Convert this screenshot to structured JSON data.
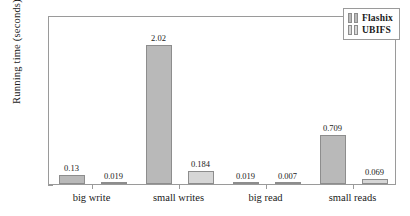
{
  "chart_data": {
    "type": "bar",
    "title": "",
    "subtitle": "",
    "xlabel": "",
    "ylabel": "Running time (seconds)",
    "categories": [
      "big write",
      "small writes",
      "big read",
      "small reads"
    ],
    "series": [
      {
        "name": "Flashix",
        "color": "#b9b9b9",
        "values": [
          0.13,
          2.02,
          0.019,
          0.709
        ]
      },
      {
        "name": "UBIFS",
        "color": "#d6d6d6",
        "values": [
          0.019,
          0.184,
          0.007,
          0.069
        ]
      }
    ],
    "value_labels": [
      [
        "0.13",
        "2.02",
        "0.019",
        "0.709"
      ],
      [
        "0.019",
        "0.184",
        "0.007",
        "0.069"
      ]
    ],
    "ylim": [
      0,
      2.45
    ],
    "yticks": [
      0,
      1,
      2
    ],
    "ytick_labels": [
      "0",
      "1",
      "2"
    ],
    "grid": false,
    "legend_position": "top-right",
    "frame": true
  },
  "legend": {
    "entries": [
      {
        "label": "Flashix",
        "color": "#b9b9b9"
      },
      {
        "label": "UBIFS",
        "color": "#d6d6d6"
      }
    ]
  },
  "colors": {
    "flashix": "#b9b9b9",
    "ubifs": "#d6d6d6",
    "axis": "#9a9a9a",
    "text": "#1a1a1a",
    "background": "#ffffff"
  }
}
